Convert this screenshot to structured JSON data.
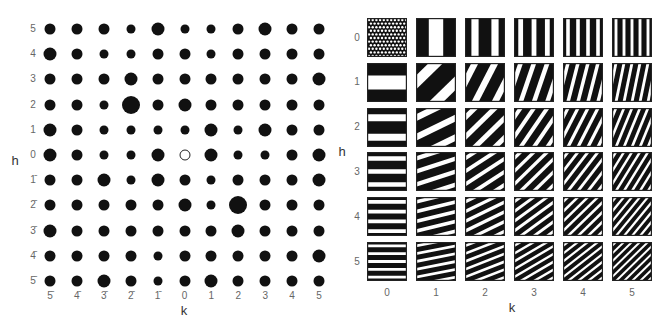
{
  "chart_data": [
    {
      "type": "scatter",
      "title": "",
      "description": "Reciprocal-lattice plane (h k): dot size encodes structure-factor amplitude; origin shown as open circle",
      "xlabel": "k",
      "ylabel": "h",
      "k_values": [
        -5,
        -4,
        -3,
        -2,
        -1,
        0,
        1,
        2,
        3,
        4,
        5
      ],
      "h_values": [
        5,
        4,
        3,
        2,
        1,
        0,
        -1,
        -2,
        -3,
        -4,
        -5
      ],
      "k_tick_labels": [
        "5̄",
        "4̄",
        "3̄",
        "2̄",
        "1̄",
        "0",
        "1",
        "2",
        "3",
        "4",
        "5"
      ],
      "h_tick_labels": [
        "5",
        "4",
        "3",
        "2",
        "1",
        "0",
        "1̄",
        "2̄",
        "3̄",
        "4̄",
        "5̄"
      ],
      "size_legend": {
        "S": 9,
        "M": 11,
        "L": 13,
        "XL": 18,
        "O": 11
      },
      "sizes": [
        [
          "M",
          "M",
          "M",
          "S",
          "L",
          "S",
          "S",
          "M",
          "L",
          "M",
          "M"
        ],
        [
          "L",
          "M",
          "S",
          "S",
          "M",
          "M",
          "S",
          "M",
          "M",
          "M",
          "M"
        ],
        [
          "M",
          "M",
          "M",
          "L",
          "M",
          "M",
          "M",
          "M",
          "M",
          "M",
          "L"
        ],
        [
          "M",
          "M",
          "S",
          "XL",
          "M",
          "L",
          "M",
          "M",
          "M",
          "M",
          "M"
        ],
        [
          "L",
          "M",
          "S",
          "S",
          "S",
          "S",
          "L",
          "S",
          "L",
          "M",
          "M"
        ],
        [
          "L",
          "M",
          "S",
          "S",
          "L",
          "O",
          "L",
          "S",
          "S",
          "M",
          "L"
        ],
        [
          "M",
          "M",
          "L",
          "S",
          "L",
          "M",
          "S",
          "M",
          "M",
          "M",
          "L"
        ],
        [
          "M",
          "M",
          "M",
          "M",
          "M",
          "L",
          "S",
          "XL",
          "M",
          "M",
          "M"
        ],
        [
          "L",
          "M",
          "M",
          "M",
          "M",
          "M",
          "M",
          "L",
          "M",
          "M",
          "M"
        ],
        [
          "M",
          "M",
          "M",
          "M",
          "S",
          "M",
          "M",
          "M",
          "M",
          "M",
          "L"
        ],
        [
          "M",
          "M",
          "L",
          "M",
          "S",
          "M",
          "L",
          "M",
          "M",
          "M",
          "M"
        ]
      ],
      "highlighted": [
        {
          "h": 2,
          "k": -2,
          "size": "XL"
        },
        {
          "h": -2,
          "k": 2,
          "size": "XL"
        },
        {
          "h": 0,
          "k": 0,
          "size": "O",
          "note": "origin (open circle)"
        }
      ]
    },
    {
      "type": "heatmap",
      "title": "",
      "description": "Fourier component fringes (sinusoidal gratings) for indices h,k = 0..5",
      "xlabel": "k",
      "ylabel": "h",
      "k_values": [
        0,
        1,
        2,
        3,
        4,
        5
      ],
      "h_values": [
        0,
        1,
        2,
        3,
        4,
        5
      ],
      "k_tick_labels": [
        "0",
        "1",
        "2",
        "3",
        "4",
        "5"
      ],
      "h_tick_labels": [
        "0",
        "1",
        "2",
        "3",
        "4",
        "5"
      ],
      "tile_00_pattern": "dot-texture",
      "fringe_color": "#111111",
      "gap_color": "#ffffff",
      "white_duty": 0.36
    }
  ],
  "left_panel": {
    "axis_x": "k",
    "axis_y": "h"
  },
  "right_panel": {
    "axis_x": "k",
    "axis_y": "h"
  }
}
